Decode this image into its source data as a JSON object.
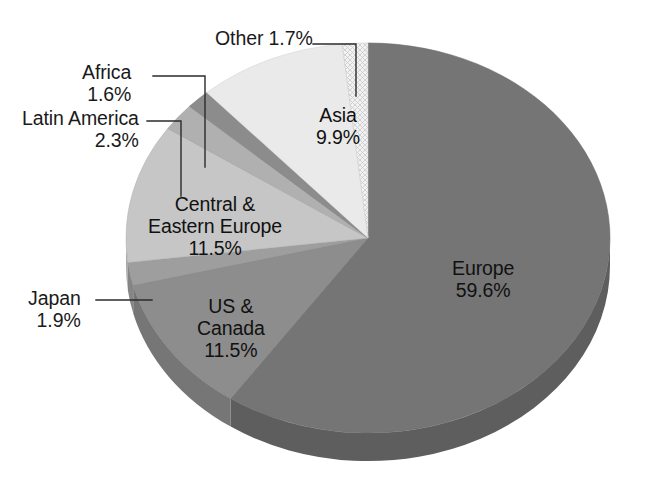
{
  "chart_data": {
    "type": "pie",
    "title": "",
    "subtitle": "",
    "xlabel": "",
    "ylabel": "",
    "legend_position": "none",
    "grid": false,
    "three_d": true,
    "start_angle_deg": 0,
    "direction": "clockwise",
    "units": "percent",
    "categories": [
      "Europe",
      "US & Canada",
      "Japan",
      "Central & Eastern Europe",
      "Latin America",
      "Africa",
      "Asia",
      "Other"
    ],
    "values": [
      59.6,
      11.5,
      1.9,
      11.5,
      2.3,
      1.6,
      9.9,
      1.7
    ],
    "slices": [
      {
        "name": "Europe",
        "value": 59.6,
        "value_text": "59.6%",
        "color": "#757575",
        "side_color": "#5e5e5e",
        "label_placement": "inside",
        "pattern": "solid"
      },
      {
        "name": "US & Canada",
        "name_line1": "US &",
        "name_line2": "Canada",
        "value": 11.5,
        "value_text": "11.5%",
        "color": "#8d8d8d",
        "side_color": "#767676",
        "label_placement": "inside",
        "pattern": "solid"
      },
      {
        "name": "Japan",
        "value": 1.9,
        "value_text": "1.9%",
        "color": "#9e9e9e",
        "side_color": "#858585",
        "label_placement": "callout-left",
        "pattern": "solid"
      },
      {
        "name": "Central & Eastern Europe",
        "name_line1": "Central &",
        "name_line2": "Eastern Europe",
        "value": 11.5,
        "value_text": "11.5%",
        "color": "#c6c6c6",
        "side_color": "#a9a9a9",
        "label_placement": "inside",
        "pattern": "solid"
      },
      {
        "name": "Latin America",
        "value": 2.3,
        "value_text": "2.3%",
        "color": "#b0b0b0",
        "side_color": "#989898",
        "label_placement": "callout-left",
        "pattern": "solid"
      },
      {
        "name": "Africa",
        "value": 1.6,
        "value_text": "1.6%",
        "color": "#8c8c8c",
        "side_color": "#787878",
        "label_placement": "callout-left",
        "pattern": "solid"
      },
      {
        "name": "Asia",
        "value": 9.9,
        "value_text": "9.9%",
        "color": "#eaeaea",
        "side_color": "#cfcfcf",
        "label_placement": "inside",
        "pattern": "solid"
      },
      {
        "name": "Other",
        "value": 1.7,
        "value_text": "1.7%",
        "color": "#dcdcdc",
        "side_color": "#c2c2c2",
        "label_placement": "callout-top",
        "pattern": "crosshatch"
      }
    ]
  },
  "labels": {
    "other": {
      "name": "Other",
      "value": "1.7%",
      "combined": "Other 1.7%"
    },
    "africa": {
      "name": "Africa",
      "value": "1.6%"
    },
    "latin": {
      "name": "Latin America",
      "value": "2.3%"
    },
    "japan": {
      "name": "Japan",
      "value": "1.9%"
    },
    "asia": {
      "name": "Asia",
      "value": "9.9%"
    },
    "cee": {
      "name_line1": "Central &",
      "name_line2": "Eastern Europe",
      "value": "11.5%"
    },
    "usca": {
      "name_line1": "US &",
      "name_line2": "Canada",
      "value": "11.5%"
    },
    "europe": {
      "name": "Europe",
      "value": "59.6%"
    }
  },
  "style": {
    "background": "#ffffff",
    "text_color": "#1a1a1a",
    "leader_line_color": "#2b2b2b"
  }
}
